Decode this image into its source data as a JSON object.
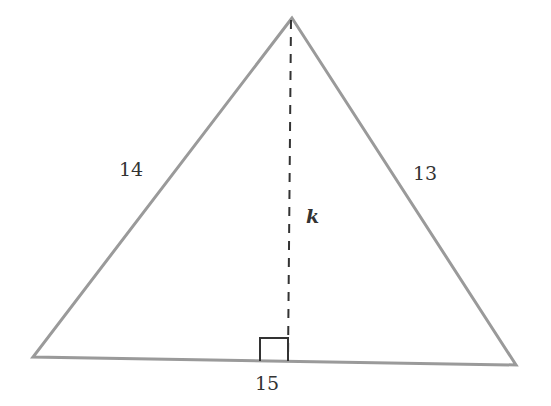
{
  "diagram": {
    "type": "triangle-with-altitude",
    "colors": {
      "edge": "#9a9a9a",
      "altitude": "#333333",
      "right_angle_marker": "#333333",
      "text": "#333333"
    },
    "vertices": {
      "apex": [
        292,
        18
      ],
      "bottom_left": [
        33,
        357
      ],
      "bottom_right": [
        516,
        365
      ]
    },
    "altitude_foot": [
      288,
      361
    ],
    "labels": {
      "left_side": "14",
      "right_side": "13",
      "base": "15",
      "altitude": "k"
    }
  }
}
